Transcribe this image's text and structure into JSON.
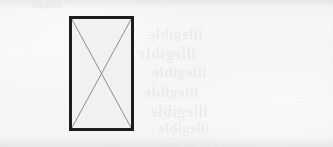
{
  "document": {
    "kind": "scanned-page-fragment",
    "width_px": 333,
    "height_px": 147,
    "background_color": "#f6f6f6",
    "description": "Scanned paper fragment containing a single crossed rectangle figure placeholder with faint reverse-side show-through text."
  },
  "figure": {
    "name": "crossed-rectangle",
    "shape": "rectangle",
    "marking": "X diagonals corner to corner",
    "x_px": 69,
    "y_px": 16,
    "width_px": 65,
    "height_px": 115,
    "center_x_px": 101,
    "center_y_px": 73,
    "border_width_px": 3,
    "border_color": "#1c1c1c",
    "fill_color": "#f1f1f1",
    "diagonal_color": "#8d8d8d",
    "diagonal_width_px": 1,
    "caption": ""
  },
  "artifacts": {
    "top_band_label": "scanner-edge-band-top",
    "bottom_band_label": "scanner-edge-band-bottom",
    "showthrough_note": "illegible mirrored text bleeding through from reverse side",
    "ghost_lines": [
      "illegible",
      "illegible",
      "illegible",
      "illegible",
      "illegible",
      "illegible"
    ],
    "ghost_top_strip": "illegible"
  }
}
